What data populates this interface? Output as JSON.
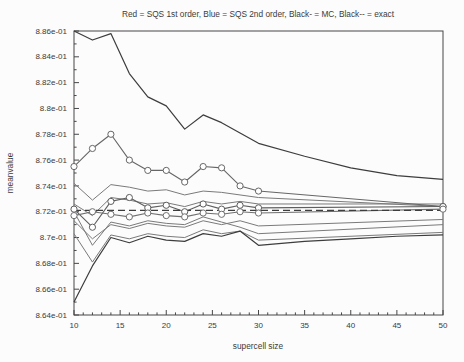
{
  "colors": {
    "background": "#fcfcfc",
    "axis": "#474747",
    "text": "#3b3b3b",
    "black_line": "#3d3d3d",
    "gray_line": "#7a7a7a"
  },
  "chart_data": {
    "type": "line",
    "title": "Red = SQS 1st order, Blue = SQS 2nd order, Black- = MC, Black-- = exact",
    "xlabel": "supercell size",
    "ylabel": "meanvalue",
    "xlim": [
      10,
      50
    ],
    "ylim": [
      0.864,
      0.886
    ],
    "grid": false,
    "legend_position": "encoded-in-title",
    "x_major_ticks": [
      10,
      15,
      20,
      25,
      30,
      35,
      40,
      45,
      50
    ],
    "x_minor_step": 1,
    "y_minor_step": 0.001,
    "y_ticks": [
      {
        "value": 0.886,
        "label": "8.86e-01"
      },
      {
        "value": 0.884,
        "label": "8.84e-01"
      },
      {
        "value": 0.882,
        "label": "8.82e-01"
      },
      {
        "value": 0.88,
        "label": "8.8e-01"
      },
      {
        "value": 0.878,
        "label": "8.78e-01"
      },
      {
        "value": 0.876,
        "label": "8.76e-01"
      },
      {
        "value": 0.874,
        "label": "8.74e-01"
      },
      {
        "value": 0.872,
        "label": "8.72e-01"
      },
      {
        "value": 0.87,
        "label": "8.7e-01"
      },
      {
        "value": 0.868,
        "label": "8.68e-01"
      },
      {
        "value": 0.866,
        "label": "8.66e-01"
      },
      {
        "value": 0.864,
        "label": "8.64e-01"
      }
    ],
    "series": [
      {
        "name": "sqs2-upper-bound",
        "color": "#7a7a7a",
        "line": "solid",
        "marker": false,
        "width": 1,
        "x": [
          10,
          12,
          14,
          16,
          18,
          20,
          22,
          24,
          26,
          28,
          30,
          50
        ],
        "y": [
          0.8726,
          0.8717,
          0.8731,
          0.8729,
          0.8726,
          0.8727,
          0.8724,
          0.8728,
          0.8726,
          0.8728,
          0.8726,
          0.8726
        ]
      },
      {
        "name": "sqs1-lower-bound",
        "color": "#7a7a7a",
        "line": "solid",
        "marker": false,
        "width": 1,
        "x": [
          10,
          12,
          14,
          16,
          18,
          20,
          22,
          24,
          26,
          28,
          30,
          50
        ],
        "y": [
          0.8742,
          0.8729,
          0.8741,
          0.8739,
          0.8736,
          0.8737,
          0.8733,
          0.8736,
          0.8735,
          0.8733,
          0.8731,
          0.8724
        ]
      },
      {
        "name": "sqs2-lower-bound",
        "color": "#7a7a7a",
        "line": "solid",
        "marker": false,
        "width": 1,
        "x": [
          10,
          12,
          14,
          16,
          18,
          20,
          22,
          24,
          26,
          28,
          30,
          50
        ],
        "y": [
          0.8713,
          0.8699,
          0.871,
          0.8707,
          0.8711,
          0.8709,
          0.8708,
          0.8713,
          0.871,
          0.8713,
          0.8709,
          0.8714
        ]
      },
      {
        "name": "sqs-lower-bound-2",
        "color": "#7a7a7a",
        "line": "solid",
        "marker": false,
        "width": 1,
        "x": [
          10,
          12,
          14,
          16,
          18,
          20,
          22,
          24,
          26,
          28,
          30,
          50
        ],
        "y": [
          0.872,
          0.8694,
          0.8712,
          0.8709,
          0.8713,
          0.8711,
          0.871,
          0.8716,
          0.8712,
          0.8708,
          0.8703,
          0.871
        ]
      },
      {
        "name": "mc-lower-companion",
        "color": "#7a7a7a",
        "line": "solid",
        "marker": false,
        "width": 1,
        "x": [
          10,
          12,
          14,
          16,
          18,
          20,
          22,
          24,
          26,
          28,
          30,
          50
        ],
        "y": [
          0.8703,
          0.8681,
          0.8702,
          0.8699,
          0.8703,
          0.8701,
          0.87,
          0.8706,
          0.8703,
          0.8705,
          0.8698,
          0.8704
        ]
      },
      {
        "name": "mc-upper",
        "color": "#3d3d3d",
        "line": "solid",
        "marker": false,
        "width": 1.2,
        "x": [
          10,
          12,
          14,
          16,
          18,
          20,
          22,
          24,
          26,
          28,
          30,
          35,
          40,
          45,
          50
        ],
        "y": [
          0.886,
          0.8853,
          0.8858,
          0.8827,
          0.8809,
          0.8802,
          0.8784,
          0.8795,
          0.8789,
          0.8781,
          0.8773,
          0.8763,
          0.8754,
          0.8748,
          0.8745
        ]
      },
      {
        "name": "mc-lower",
        "color": "#3d3d3d",
        "line": "solid",
        "marker": false,
        "width": 1.2,
        "x": [
          10,
          12,
          14,
          16,
          18,
          20,
          22,
          24,
          26,
          28,
          30,
          35,
          40,
          45,
          50
        ],
        "y": [
          0.865,
          0.8678,
          0.87,
          0.8696,
          0.8701,
          0.8698,
          0.8697,
          0.8703,
          0.8701,
          0.8705,
          0.8694,
          0.8697,
          0.8699,
          0.8701,
          0.8702
        ]
      },
      {
        "name": "sqs1-mean",
        "color": "#666666",
        "line": "solid",
        "marker": true,
        "width": 1.1,
        "x": [
          10,
          12,
          14,
          16,
          18,
          20,
          22,
          24,
          26,
          28,
          30,
          50
        ],
        "y": [
          0.8755,
          0.8769,
          0.878,
          0.876,
          0.8752,
          0.8752,
          0.8743,
          0.8755,
          0.8754,
          0.874,
          0.8736,
          0.8724
        ]
      },
      {
        "name": "sqs2-mean",
        "color": "#5e5e5e",
        "line": "solid",
        "marker": true,
        "width": 1.1,
        "x": [
          10,
          12,
          14,
          16,
          18,
          20,
          22,
          24,
          26,
          28,
          30,
          50
        ],
        "y": [
          0.8722,
          0.8708,
          0.8728,
          0.8731,
          0.8723,
          0.8725,
          0.872,
          0.8726,
          0.8722,
          0.8725,
          0.8723,
          0.8724
        ]
      },
      {
        "name": "sqs2-mean-2",
        "color": "#707070",
        "line": "solid",
        "marker": true,
        "width": 1.1,
        "x": [
          10,
          12,
          14,
          16,
          18,
          20,
          22,
          24,
          26,
          28,
          30,
          50
        ],
        "y": [
          0.8717,
          0.872,
          0.8718,
          0.8716,
          0.8719,
          0.8717,
          0.8716,
          0.8719,
          0.8718,
          0.872,
          0.8719,
          0.8722
        ]
      },
      {
        "name": "exact",
        "color": "#3d3d3d",
        "line": "dashed",
        "marker": false,
        "width": 1.2,
        "x": [
          10,
          50
        ],
        "y": [
          0.8721,
          0.8721
        ]
      }
    ]
  }
}
